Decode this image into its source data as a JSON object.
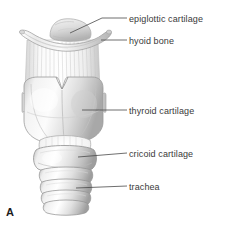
{
  "figure": {
    "panel_letter": "A",
    "background_color": "#ffffff",
    "label_color": "#3a3a3a",
    "leader_color": "#4a4a4a"
  },
  "labels": [
    {
      "id": "epiglottic",
      "text": "epiglottic cartilage"
    },
    {
      "id": "hyoid",
      "text": "hyoid bone"
    },
    {
      "id": "thyroid",
      "text": "thyroid cartilage"
    },
    {
      "id": "cricoid",
      "text": "cricoid cartilage"
    },
    {
      "id": "trachea",
      "text": "trachea"
    }
  ],
  "structures": [
    {
      "name": "epiglottic-cartilage"
    },
    {
      "name": "hyoid-bone"
    },
    {
      "name": "thyrohyoid-membrane"
    },
    {
      "name": "thyroid-cartilage"
    },
    {
      "name": "cricothyroid-ligament"
    },
    {
      "name": "cricoid-cartilage"
    },
    {
      "name": "trachea-rings"
    }
  ]
}
